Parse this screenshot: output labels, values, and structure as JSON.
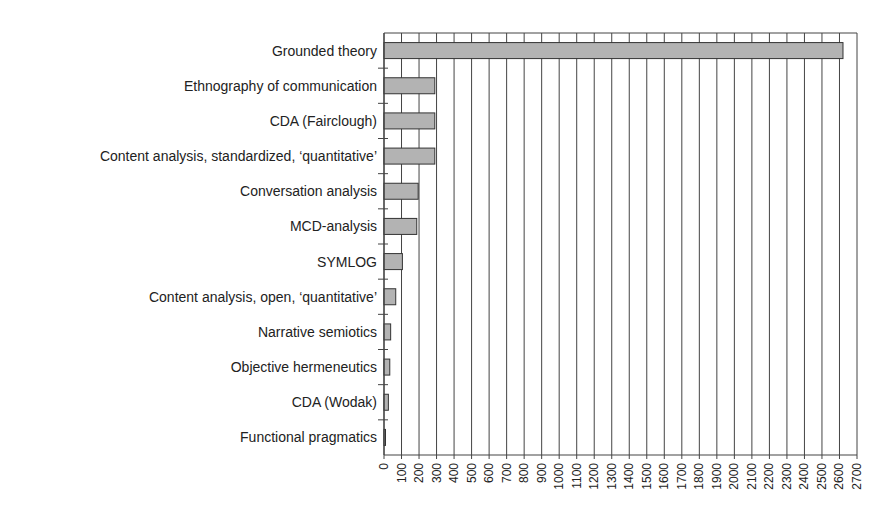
{
  "chart_data": {
    "type": "bar",
    "orientation": "horizontal",
    "title": "",
    "xlabel": "",
    "ylabel": "",
    "categories": [
      "Grounded theory",
      "Ethnography of communication",
      "CDA (Fairclough)",
      "Content analysis, standardized, ‘quantitative’",
      "Conversation analysis",
      "MCD-analysis",
      "SYMLOG",
      "Content analysis, open, ‘quantitative’",
      "Narrative semiotics",
      "Objective hermeneutics",
      "CDA (Wodak)",
      "Functional pragmatics"
    ],
    "values": [
      2620,
      290,
      290,
      290,
      195,
      187,
      105,
      67,
      38,
      33,
      25,
      5
    ],
    "xlim": [
      0,
      2700
    ],
    "xticks": [
      0,
      100,
      200,
      300,
      400,
      500,
      600,
      700,
      800,
      900,
      1000,
      1100,
      1200,
      1300,
      1400,
      1500,
      1600,
      1700,
      1800,
      1900,
      2000,
      2100,
      2200,
      2300,
      2400,
      2500,
      2600,
      2700
    ],
    "grid": "vertical",
    "legend": "none",
    "colors": {
      "bar_fill": "#b3b3b3",
      "bar_stroke": "#333333",
      "grid": "#444444"
    }
  }
}
